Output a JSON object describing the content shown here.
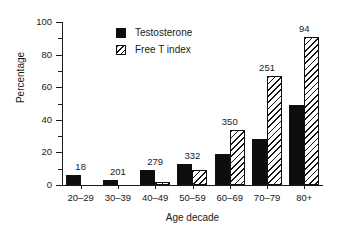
{
  "chart_data": {
    "type": "bar",
    "title": "",
    "xlabel": "Age decade",
    "ylabel": "Percentage",
    "ylim": [
      0,
      100
    ],
    "ytick_values": [
      0,
      20,
      40,
      60,
      80,
      100
    ],
    "ytick_labels": [
      "0",
      "20",
      "40",
      "60",
      "80",
      "100"
    ],
    "yminor_values": [
      10,
      30,
      50,
      70,
      90
    ],
    "grid": false,
    "legend_position": "upper-left-inside",
    "categories": [
      "20–29",
      "30–39",
      "40–49",
      "50–59",
      "60–69",
      "70–79",
      "80+"
    ],
    "series": [
      {
        "name": "Testosterone",
        "style": "solid",
        "color": "#0d0d0d",
        "values": [
          6,
          3,
          9,
          13,
          19,
          28,
          49
        ]
      },
      {
        "name": "Free T index",
        "style": "hatch",
        "color": "#ffffff",
        "values": [
          0,
          0,
          2,
          9,
          34,
          67,
          91
        ]
      }
    ],
    "group_annotations": [
      "18",
      "201",
      "279",
      "332",
      "350",
      "251",
      "94"
    ],
    "annotation_note": "Number of subjects (n) per age decade, printed above each group"
  },
  "legend": {
    "items": [
      {
        "label": "Testosterone",
        "swatch": "solid-black-square"
      },
      {
        "label": "Free T index",
        "swatch": "diagonal-hatch-square"
      }
    ]
  }
}
